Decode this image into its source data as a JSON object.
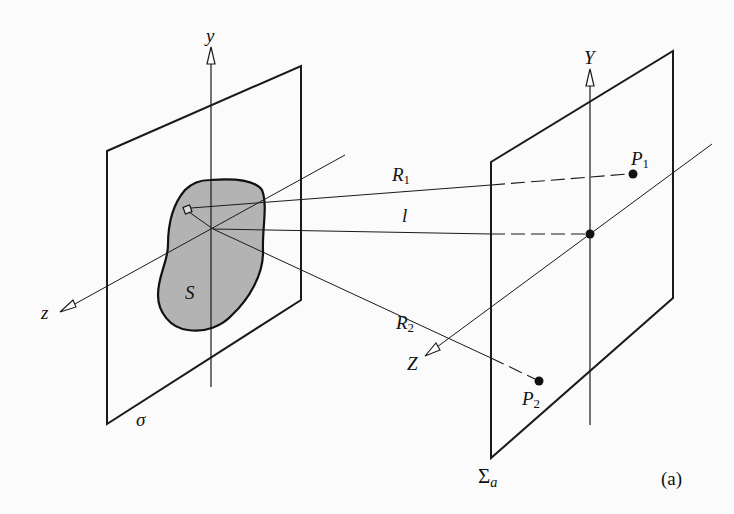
{
  "figure": {
    "panel_label": "(a)",
    "colors": {
      "line": "#1a1a1a",
      "aperture_fill": "#b3b3b3",
      "background": "#fbfbfb"
    },
    "source_plane": {
      "name_label": "σ",
      "aperture_label": "S",
      "axes": {
        "y": "y",
        "z": "z"
      }
    },
    "observation_plane": {
      "name_label": "Σ",
      "name_subscript": "a",
      "axes": {
        "Y": "Y",
        "Z": "Z"
      }
    },
    "rays": [
      {
        "label": "R",
        "subscript": "1",
        "to_point": "P1"
      },
      {
        "label": "l",
        "subscript": "",
        "to_point": "origin"
      },
      {
        "label": "R",
        "subscript": "2",
        "to_point": "P2"
      }
    ],
    "points": [
      {
        "label": "P",
        "subscript": "1"
      },
      {
        "label": "P",
        "subscript": "2"
      }
    ]
  }
}
